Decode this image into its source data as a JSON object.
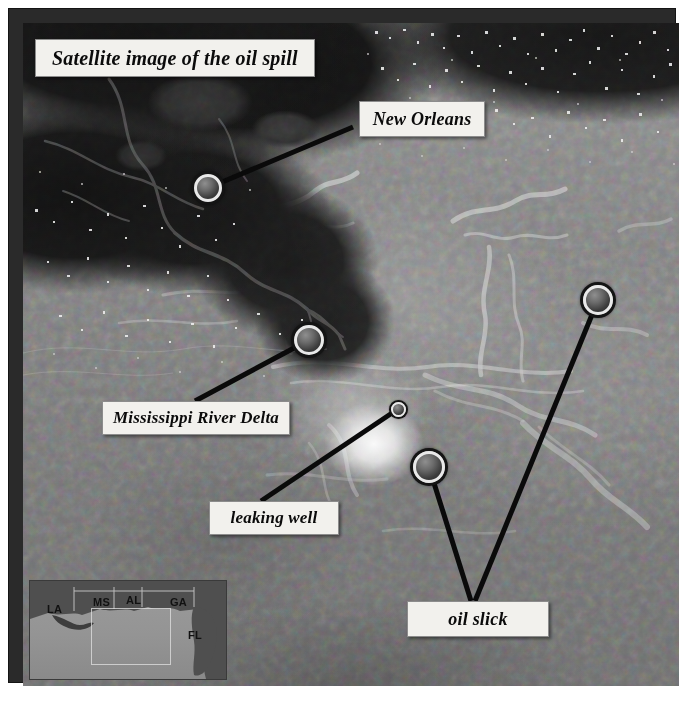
{
  "figure": {
    "title": "Satellite image of the oil spill",
    "kind": "satellite-photograph"
  },
  "annotations": [
    {
      "id": "new-orleans",
      "label": "New Orleans",
      "marker": {
        "x": 185,
        "y": 165,
        "size": 28
      }
    },
    {
      "id": "mississippi-delta",
      "label": "Mississippi River Delta",
      "marker": {
        "x": 286,
        "y": 317,
        "size": 30
      }
    },
    {
      "id": "leaking-well",
      "label": "leaking well",
      "marker": {
        "x": 375,
        "y": 386,
        "size": 15
      }
    },
    {
      "id": "oil-slick-1",
      "label": "oil slick",
      "marker": {
        "x": 406,
        "y": 444,
        "size": 32
      }
    },
    {
      "id": "oil-slick-2",
      "label": "oil slick",
      "marker": {
        "x": 575,
        "y": 277,
        "size": 30
      }
    }
  ],
  "inset_map": {
    "name": "locator-map",
    "state_labels": [
      {
        "abbr": "LA",
        "x": 17,
        "y": 22
      },
      {
        "abbr": "MS",
        "x": 63,
        "y": 15
      },
      {
        "abbr": "AL",
        "x": 96,
        "y": 13
      },
      {
        "abbr": "GA",
        "x": 140,
        "y": 15
      },
      {
        "abbr": "FL",
        "x": 158,
        "y": 48
      }
    ],
    "extent_box_label": "main image extent"
  },
  "colors": {
    "frame": "#2a2a2a",
    "label_background": "#f2f1ed",
    "label_text": "#0b0b0b",
    "leader_line": "#0a0a0a",
    "water": "#868686",
    "land": "#151515",
    "oil_plume": "#ffffff"
  }
}
